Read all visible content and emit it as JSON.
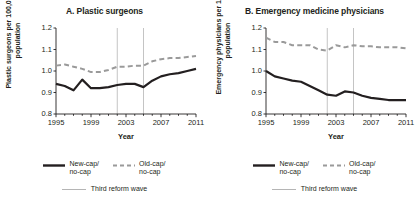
{
  "figure": {
    "width": 419,
    "height": 213,
    "background": "#ffffff"
  },
  "legend": {
    "new_cap_label_line1": "New-cap/",
    "new_cap_label_line2": "no-cap",
    "old_cap_label_line1": "Old-cap/",
    "old_cap_label_line2": "no-cap",
    "third_reform_label": "Third reform wave",
    "new_cap_color": "#231f20",
    "old_cap_color": "#9a9a9a",
    "third_reform_color": "#b5b5b5"
  },
  "chart_data": [
    {
      "type": "line",
      "panel": "A",
      "title": "A. Plastic surgeons",
      "xlabel": "Year",
      "ylabel": "Plastic surgeons per 100,000 population",
      "ylim": [
        0.8,
        1.2
      ],
      "xlim": [
        1995,
        2011
      ],
      "yticks": [
        "0.8",
        "0.9",
        "1.0",
        "1.1",
        "1.2"
      ],
      "ytick_values": [
        0.8,
        0.9,
        1.0,
        1.1,
        1.2
      ],
      "xticks": [
        "1995",
        "1999",
        "2003",
        "2007",
        "2011"
      ],
      "xtick_values": [
        1995,
        1999,
        2003,
        2007,
        2011
      ],
      "grid": false,
      "legend_position": "below",
      "x": [
        1995,
        1996,
        1997,
        1998,
        1999,
        2000,
        2001,
        2002,
        2003,
        2004,
        2005,
        2006,
        2007,
        2008,
        2009,
        2010,
        2011
      ],
      "series": [
        {
          "name": "New-cap/no-cap",
          "style": "solid",
          "color": "#231f20",
          "values": [
            0.94,
            0.93,
            0.91,
            0.96,
            0.92,
            0.92,
            0.925,
            0.935,
            0.94,
            0.94,
            0.925,
            0.955,
            0.975,
            0.985,
            0.99,
            1.0,
            1.01
          ]
        },
        {
          "name": "Old-cap/no-cap",
          "style": "dashed",
          "color": "#9a9a9a",
          "values": [
            1.025,
            1.03,
            1.02,
            1.01,
            0.995,
            0.995,
            1.005,
            1.02,
            1.02,
            1.025,
            1.025,
            1.045,
            1.055,
            1.06,
            1.06,
            1.065,
            1.07
          ]
        }
      ],
      "vlines": [
        {
          "label": "Third reform wave",
          "x": 2002,
          "color": "#b5b5b5"
        },
        {
          "label": "Third reform wave",
          "x": 2005,
          "color": "#b5b5b5"
        }
      ]
    },
    {
      "type": "line",
      "panel": "B",
      "title": "B. Emergency medicine physicians",
      "xlabel": "Year",
      "ylabel": "Emergency physicians per 1,000 population",
      "ylim": [
        0.8,
        1.2
      ],
      "xlim": [
        1995,
        2011
      ],
      "yticks": [
        "0.8",
        "0.9",
        "1.0",
        "1.1",
        "1.2"
      ],
      "ytick_values": [
        0.8,
        0.9,
        1.0,
        1.1,
        1.2
      ],
      "xticks": [
        "1995",
        "1999",
        "2003",
        "2007",
        "2011"
      ],
      "xtick_values": [
        1995,
        1999,
        2003,
        2007,
        2011
      ],
      "grid": false,
      "legend_position": "below",
      "x": [
        1995,
        1996,
        1997,
        1998,
        1999,
        2000,
        2001,
        2002,
        2003,
        2004,
        2005,
        2006,
        2007,
        2008,
        2009,
        2010,
        2011
      ],
      "series": [
        {
          "name": "New-cap/no-cap",
          "style": "solid",
          "color": "#231f20",
          "values": [
            1.0,
            0.975,
            0.965,
            0.955,
            0.95,
            0.93,
            0.91,
            0.89,
            0.885,
            0.905,
            0.9,
            0.885,
            0.875,
            0.87,
            0.865,
            0.865,
            0.865
          ]
        },
        {
          "name": "Old-cap/no-cap",
          "style": "dashed",
          "color": "#9a9a9a",
          "values": [
            1.155,
            1.135,
            1.135,
            1.12,
            1.12,
            1.12,
            1.1,
            1.095,
            1.12,
            1.11,
            1.12,
            1.115,
            1.115,
            1.11,
            1.11,
            1.11,
            1.105
          ]
        }
      ],
      "vlines": [
        {
          "label": "Third reform wave",
          "x": 2002,
          "color": "#b5b5b5"
        },
        {
          "label": "Third reform wave",
          "x": 2005,
          "color": "#b5b5b5"
        }
      ]
    }
  ]
}
